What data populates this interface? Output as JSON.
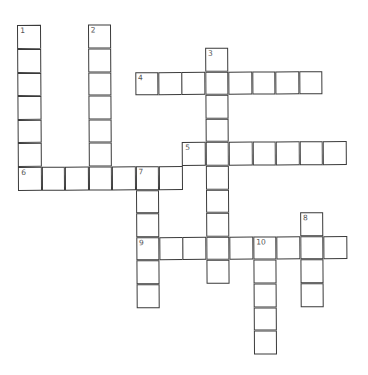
{
  "puzzle": {
    "type": "crossword",
    "origin": {
      "x": 19,
      "y": 25
    },
    "cell_size": {
      "w": 23.45,
      "h": 23.6
    },
    "line_color": "#3a3a3a",
    "words": [
      {
        "number": "1",
        "direction": "down",
        "row": 0,
        "col": 0,
        "length": 7
      },
      {
        "number": "2",
        "direction": "down",
        "row": 0,
        "col": 3,
        "length": 7
      },
      {
        "number": "3",
        "direction": "down",
        "row": 1,
        "col": 8,
        "length": 10
      },
      {
        "number": "4",
        "direction": "across",
        "row": 2,
        "col": 5,
        "length": 8
      },
      {
        "number": "5",
        "direction": "across",
        "row": 5,
        "col": 7,
        "length": 7
      },
      {
        "number": "6",
        "direction": "across",
        "row": 6,
        "col": 0,
        "length": 7
      },
      {
        "number": "7",
        "direction": "down",
        "row": 6,
        "col": 5,
        "length": 6
      },
      {
        "number": "8",
        "direction": "down",
        "row": 8,
        "col": 12,
        "length": 4
      },
      {
        "number": "9",
        "direction": "across",
        "row": 9,
        "col": 5,
        "length": 9
      },
      {
        "number": "10",
        "direction": "down",
        "row": 9,
        "col": 10,
        "length": 5
      }
    ]
  }
}
